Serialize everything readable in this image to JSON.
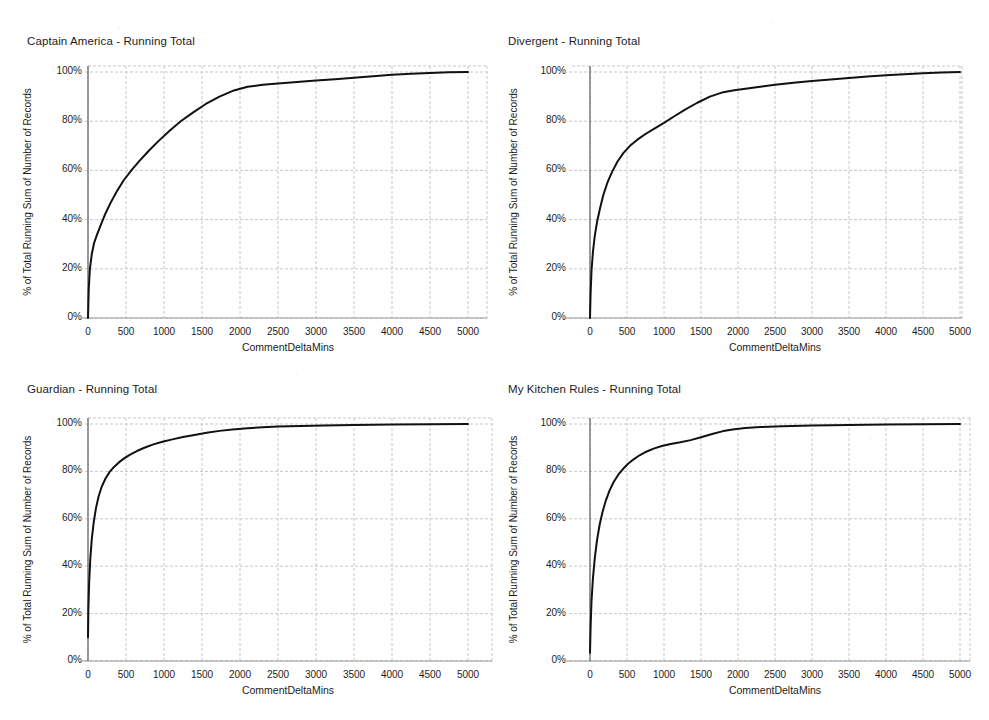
{
  "page": {
    "width": 989,
    "height": 720,
    "background": "#ffffff"
  },
  "style": {
    "line_color": "#111111",
    "grid_color": "#c8c8c8",
    "axis_color": "#6a6a6a",
    "text_color": "#1c1c1c"
  },
  "axis_common": {
    "xlabel": "CommentDeltaMins",
    "ylabel": "% of Total Running Sum of Number of Records",
    "xticks": [
      "0",
      "500",
      "1000",
      "1500",
      "2000",
      "2500",
      "3000",
      "3500",
      "4000",
      "4500",
      "5000"
    ],
    "yticks": [
      "0%",
      "20%",
      "40%",
      "60%",
      "80%",
      "100%"
    ],
    "xlim": [
      0,
      5000
    ],
    "ylim": [
      0,
      100
    ]
  },
  "chart_data": [
    {
      "id": "captain-america",
      "type": "line",
      "title": "Captain America - Running Total",
      "xlabel": "CommentDeltaMins",
      "ylabel": "% of Total Running Sum of Number of Records",
      "xlim": [
        0,
        5000
      ],
      "ylim": [
        0,
        100
      ],
      "xticks": [
        0,
        500,
        1000,
        1500,
        2000,
        2500,
        3000,
        3500,
        4000,
        4500,
        5000
      ],
      "yticks": [
        0,
        20,
        40,
        60,
        80,
        100
      ],
      "grid": true,
      "legend": "none",
      "series": [
        {
          "name": "% of Total Running Sum of Number of Records",
          "x": [
            0,
            10,
            25,
            50,
            80,
            120,
            170,
            230,
            300,
            380,
            470,
            570,
            680,
            800,
            930,
            1070,
            1220,
            1380,
            1550,
            1730,
            1920,
            2100,
            2300,
            2500,
            2750,
            3000,
            3250,
            3500,
            3750,
            4000,
            4250,
            4500,
            4750,
            5000
          ],
          "values": [
            0,
            12,
            20,
            26,
            30.5,
            34,
            38,
            42.5,
            47,
            51.5,
            56,
            60,
            64,
            68,
            72,
            76,
            80,
            83.5,
            87,
            90,
            92.5,
            94,
            94.8,
            95.3,
            95.9,
            96.5,
            97.1,
            97.7,
            98.3,
            98.9,
            99.3,
            99.6,
            99.85,
            100
          ]
        }
      ]
    },
    {
      "id": "divergent",
      "type": "line",
      "title": "Divergent - Running Total",
      "xlabel": "CommentDeltaMins",
      "ylabel": "% of Total Running Sum of Number of Records",
      "xlim": [
        0,
        5000
      ],
      "ylim": [
        0,
        100
      ],
      "xticks": [
        0,
        500,
        1000,
        1500,
        2000,
        2500,
        3000,
        3500,
        4000,
        4500,
        5000
      ],
      "yticks": [
        0,
        20,
        40,
        60,
        80,
        100
      ],
      "grid": true,
      "legend": "none",
      "series": [
        {
          "name": "% of Total Running Sum of Number of Records",
          "x": [
            0,
            8,
            20,
            40,
            65,
            95,
            135,
            180,
            235,
            300,
            370,
            450,
            540,
            640,
            750,
            870,
            1000,
            1140,
            1290,
            1450,
            1620,
            1800,
            1950,
            2100,
            2300,
            2500,
            2750,
            3000,
            3250,
            3500,
            3750,
            4000,
            4250,
            4500,
            4750,
            5000
          ],
          "values": [
            0,
            10,
            19,
            27,
            33.5,
            39,
            44.5,
            50,
            55,
            59.5,
            63.5,
            67,
            70,
            72.5,
            74.8,
            77,
            79.3,
            82,
            84.8,
            87.5,
            90,
            91.8,
            92.6,
            93.2,
            94,
            94.8,
            95.6,
            96.3,
            97,
            97.6,
            98.2,
            98.7,
            99.1,
            99.5,
            99.8,
            100
          ]
        }
      ]
    },
    {
      "id": "guardian",
      "type": "line",
      "title": "Guardian - Running Total",
      "xlabel": "CommentDeltaMins",
      "ylabel": "% of Total Running Sum of Number of Records",
      "xlim": [
        0,
        5000
      ],
      "ylim": [
        0,
        100
      ],
      "xticks": [
        0,
        500,
        1000,
        1500,
        2000,
        2500,
        3000,
        3500,
        4000,
        4500,
        5000
      ],
      "yticks": [
        0,
        20,
        40,
        60,
        80,
        100
      ],
      "grid": true,
      "legend": "none",
      "series": [
        {
          "name": "% of Total Running Sum of Number of Records",
          "x": [
            0,
            5,
            15,
            30,
            50,
            75,
            105,
            140,
            180,
            230,
            285,
            345,
            410,
            480,
            560,
            650,
            750,
            860,
            980,
            1110,
            1250,
            1400,
            1560,
            1730,
            1900,
            2100,
            2300,
            2500,
            2800,
            3100,
            3500,
            4000,
            4500,
            5000
          ],
          "values": [
            10,
            22,
            33,
            43,
            51.5,
            58.5,
            64.5,
            69.5,
            73.5,
            77,
            79.8,
            82,
            83.9,
            85.6,
            87.2,
            88.7,
            90.1,
            91.4,
            92.5,
            93.5,
            94.5,
            95.4,
            96.3,
            97.1,
            97.7,
            98.2,
            98.6,
            98.9,
            99.2,
            99.4,
            99.6,
            99.8,
            99.9,
            100
          ]
        }
      ]
    },
    {
      "id": "my-kitchen-rules",
      "type": "line",
      "title": "My Kitchen Rules - Running Total",
      "xlabel": "CommentDeltaMins",
      "ylabel": "% of Total Running Sum of Number of Records",
      "xlim": [
        0,
        5000
      ],
      "ylim": [
        0,
        100
      ],
      "xticks": [
        0,
        500,
        1000,
        1500,
        2000,
        2500,
        3000,
        3500,
        4000,
        4500,
        5000
      ],
      "yticks": [
        0,
        20,
        40,
        60,
        80,
        100
      ],
      "grid": true,
      "legend": "none",
      "series": [
        {
          "name": "% of Total Running Sum of Number of Records",
          "x": [
            0,
            8,
            20,
            40,
            65,
            95,
            130,
            170,
            215,
            265,
            320,
            380,
            445,
            515,
            590,
            670,
            760,
            860,
            970,
            1090,
            1220,
            1360,
            1500,
            1650,
            1800,
            1950,
            2100,
            2300,
            2600,
            3000,
            3500,
            4000,
            4500,
            5000
          ],
          "values": [
            3.5,
            14,
            25,
            35,
            43.5,
            51,
            57.5,
            63,
            67.8,
            72,
            75.5,
            78.5,
            81,
            83.2,
            85.1,
            86.8,
            88.3,
            89.6,
            90.7,
            91.6,
            92.3,
            93.2,
            94.4,
            95.8,
            97,
            97.8,
            98.3,
            98.7,
            99.1,
            99.4,
            99.6,
            99.8,
            99.9,
            100
          ]
        }
      ]
    }
  ]
}
